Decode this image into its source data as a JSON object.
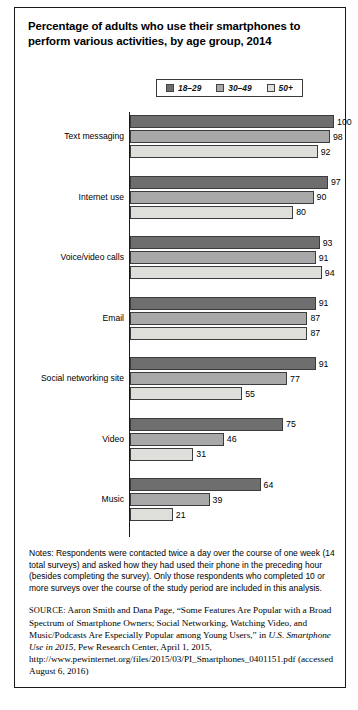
{
  "figure": {
    "title": "Percentage of adults who use their smartphones to perform various activities, by age group, 2014"
  },
  "legend": {
    "position": "top",
    "entries": [
      {
        "label": "18–29",
        "color": "#6e6e6e"
      },
      {
        "label": "30–49",
        "color": "#a8a8a8"
      },
      {
        "label": "50+",
        "color": "#dededb"
      }
    ]
  },
  "chart_data": {
    "type": "bar",
    "orientation": "horizontal",
    "title": "Percentage of adults who use their smartphones to perform various activities, by age group, 2014",
    "xlabel": "",
    "ylabel": "",
    "xlim": [
      0,
      100
    ],
    "grid": false,
    "legend_position": "top",
    "categories": [
      "Text messaging",
      "Internet use",
      "Voice/video calls",
      "Email",
      "Social networking site",
      "Video",
      "Music"
    ],
    "series": [
      {
        "name": "18–29",
        "color": "#6e6e6e",
        "values": [
          100,
          97,
          93,
          91,
          91,
          75,
          64
        ]
      },
      {
        "name": "30–49",
        "color": "#a8a8a8",
        "values": [
          98,
          90,
          91,
          87,
          77,
          46,
          39
        ]
      },
      {
        "name": "50+",
        "color": "#dededb",
        "values": [
          92,
          80,
          94,
          87,
          55,
          31,
          21
        ]
      }
    ]
  },
  "notes": {
    "text": "Notes: Respondents were contacted twice a day over the course of one week (14 total surveys) and asked how they had used their phone in the preceding hour (besides completing the survey). Only those respondents who completed 10 or more surveys over the course of the study period are included in this analysis."
  },
  "source": {
    "label": "SOURCE:",
    "part1": " Aaron Smith and Dana Page, “Some Features Are Popular with a Broad Spectrum of Smartphone Owners; Social Networking, Watching Video, and Music/Podcasts Are Especially Popular among Young Users,” in ",
    "italic": "U.S. Smartphone Use in 2015",
    "part2": ", Pew Research Center, April 1, 2015, http://www.pewinternet.org/files/2015/03/PI_Smartphones_0401151.pdf (accessed August 6, 2016)"
  }
}
